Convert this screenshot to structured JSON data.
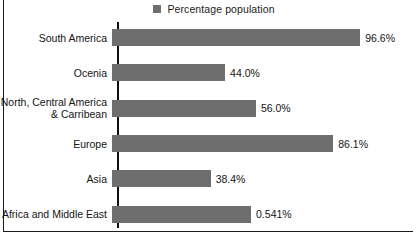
{
  "legend": {
    "swatch_name": "legend-color-swatch",
    "swatch_color": "#6e6e6e",
    "label": "Percentage population"
  },
  "colors": {
    "bar": "#6e6e6e",
    "axis": "#101010",
    "text": "#141414",
    "background": "#ffffff"
  },
  "chart_data": {
    "type": "bar",
    "orientation": "horizontal",
    "title": "",
    "subtitle": "",
    "xlabel": "",
    "ylabel": "",
    "grid": false,
    "legend_position": "top-center",
    "series": [
      {
        "name": "Percentage population",
        "categories": [
          "South America",
          "Ocenia",
          "North, Central America\n& Carribean",
          "Europe",
          "Asia",
          "Africa and Middle East"
        ],
        "values": [
          96.6,
          44.0,
          56.0,
          86.1,
          38.4,
          54.1
        ],
        "data_labels": [
          "96.6%",
          "44.0%",
          "56.0%",
          "86.1%",
          "38.4%",
          "0.541%"
        ]
      }
    ],
    "xlim": [
      0,
      100
    ],
    "bars": [
      {
        "category": "South America",
        "value": 96.6,
        "label": "96.6%"
      },
      {
        "category": "Ocenia",
        "value": 44.0,
        "label": "44.0%"
      },
      {
        "category": "North, Central America\n& Carribean",
        "value": 56.0,
        "label": "56.0%"
      },
      {
        "category": "Europe",
        "value": 86.1,
        "label": "86.1%"
      },
      {
        "category": "Asia",
        "value": 38.4,
        "label": "38.4%"
      },
      {
        "category": "Africa and Middle East",
        "value": 54.1,
        "label": "0.541%"
      }
    ]
  }
}
